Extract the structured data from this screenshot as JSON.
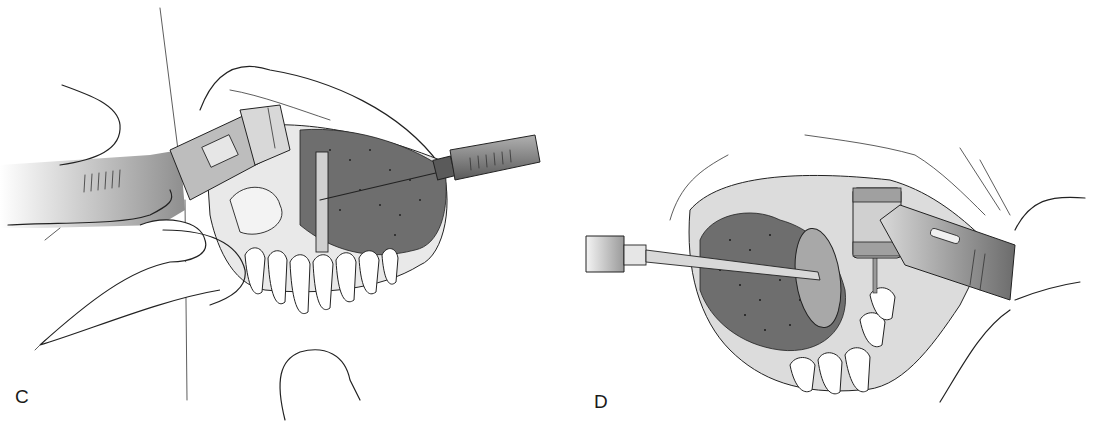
{
  "figure": {
    "panels": [
      {
        "label": "C",
        "description": "Intraoral view: dental handpiece with bur held from left, mouth mirror / retractor instrument from right retracting tongue, lower anterior teeth visible, fingers retracting lip"
      },
      {
        "label": "D",
        "description": "Intraoral view: mirror instrument from left retracting tongue, contra-angle handpiece from right drilling lingual area, lower teeth visible"
      }
    ],
    "colors": {
      "line": "#222222",
      "tongue_fill": "#6e6e6e",
      "instrument_fill": "#a8a8a8",
      "background": "#ffffff"
    }
  }
}
